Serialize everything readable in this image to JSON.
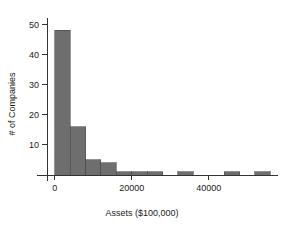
{
  "chart_data": {
    "type": "bar",
    "title": "",
    "subtitle": "",
    "xlabel": "Assets ($100,000)",
    "ylabel": "# of Companies",
    "grid": false,
    "legend": false,
    "legend_position": "none",
    "xlim": [
      -2000,
      58000
    ],
    "ylim": [
      0,
      52
    ],
    "xticks": [
      0,
      20000,
      40000
    ],
    "xticklabels": [
      "0",
      "20000",
      "40000"
    ],
    "yticks": [
      10,
      20,
      30,
      40,
      50
    ],
    "yticklabels": [
      "10",
      "20",
      "30",
      "40",
      "50"
    ],
    "bin_width": 4000,
    "bin_edges": [
      0,
      4000,
      8000,
      12000,
      16000,
      20000,
      24000,
      28000,
      32000,
      36000,
      40000,
      44000,
      48000,
      52000,
      56000
    ],
    "categories": [
      "0-4000",
      "4000-8000",
      "8000-12000",
      "12000-16000",
      "16000-20000",
      "20000-24000",
      "24000-28000",
      "28000-32000",
      "32000-36000",
      "36000-40000",
      "40000-44000",
      "44000-48000",
      "48000-52000",
      "52000-56000"
    ],
    "values": [
      48,
      16,
      5,
      4,
      1,
      1,
      1,
      0,
      1,
      0,
      0,
      1,
      0,
      1
    ],
    "bar_color": "#6e6e6e",
    "bar_edge_color": "#4a4a4a",
    "axis_color": "#333333",
    "text_color": "#1a1a1a",
    "background_color": "#ffffff"
  },
  "axis": {
    "x_title": "Assets ($100,000)",
    "y_title": "# of Companies"
  }
}
